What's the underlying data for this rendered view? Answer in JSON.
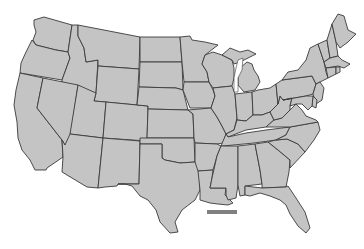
{
  "map": {
    "title": "United States (contiguous) outline map",
    "fill_color": "#c4c4c4",
    "border_color": "#3a3a3a",
    "background_color": "#ffffff",
    "highlight_bar_color": "#808080",
    "states": [
      {
        "id": "WA",
        "name": "Washington"
      },
      {
        "id": "OR",
        "name": "Oregon"
      },
      {
        "id": "CA",
        "name": "California"
      },
      {
        "id": "ID",
        "name": "Idaho"
      },
      {
        "id": "NV",
        "name": "Nevada"
      },
      {
        "id": "MT",
        "name": "Montana"
      },
      {
        "id": "WY",
        "name": "Wyoming"
      },
      {
        "id": "UT",
        "name": "Utah"
      },
      {
        "id": "AZ",
        "name": "Arizona"
      },
      {
        "id": "CO",
        "name": "Colorado"
      },
      {
        "id": "NM",
        "name": "New Mexico"
      },
      {
        "id": "ND",
        "name": "North Dakota"
      },
      {
        "id": "SD",
        "name": "South Dakota"
      },
      {
        "id": "NE",
        "name": "Nebraska"
      },
      {
        "id": "KS",
        "name": "Kansas"
      },
      {
        "id": "OK",
        "name": "Oklahoma"
      },
      {
        "id": "TX",
        "name": "Texas"
      },
      {
        "id": "MN",
        "name": "Minnesota"
      },
      {
        "id": "IA",
        "name": "Iowa"
      },
      {
        "id": "MO",
        "name": "Missouri"
      },
      {
        "id": "AR",
        "name": "Arkansas"
      },
      {
        "id": "LA",
        "name": "Louisiana"
      },
      {
        "id": "WI",
        "name": "Wisconsin"
      },
      {
        "id": "IL",
        "name": "Illinois"
      },
      {
        "id": "MI",
        "name": "Michigan"
      },
      {
        "id": "IN",
        "name": "Indiana"
      },
      {
        "id": "OH",
        "name": "Ohio"
      },
      {
        "id": "KY",
        "name": "Kentucky"
      },
      {
        "id": "TN",
        "name": "Tennessee"
      },
      {
        "id": "MS",
        "name": "Mississippi"
      },
      {
        "id": "AL",
        "name": "Alabama"
      },
      {
        "id": "GA",
        "name": "Georgia"
      },
      {
        "id": "FL",
        "name": "Florida"
      },
      {
        "id": "SC",
        "name": "South Carolina"
      },
      {
        "id": "NC",
        "name": "North Carolina"
      },
      {
        "id": "VA",
        "name": "Virginia"
      },
      {
        "id": "WV",
        "name": "West Virginia"
      },
      {
        "id": "PA",
        "name": "Pennsylvania"
      },
      {
        "id": "NY",
        "name": "New York"
      },
      {
        "id": "NJ",
        "name": "New Jersey"
      },
      {
        "id": "DE",
        "name": "Delaware"
      },
      {
        "id": "MD",
        "name": "Maryland"
      },
      {
        "id": "VT",
        "name": "Vermont"
      },
      {
        "id": "NH",
        "name": "New Hampshire"
      },
      {
        "id": "ME",
        "name": "Maine"
      },
      {
        "id": "MA",
        "name": "Massachusetts"
      },
      {
        "id": "CT",
        "name": "Connecticut"
      },
      {
        "id": "RI",
        "name": "Rhode Island"
      }
    ]
  }
}
